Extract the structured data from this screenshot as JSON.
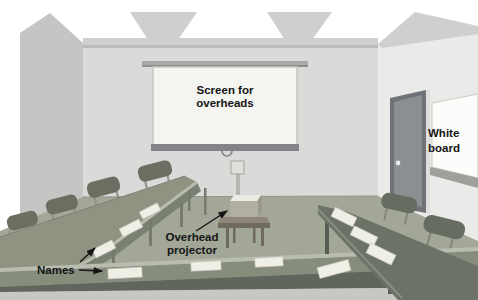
{
  "diagram": {
    "labels": {
      "screen": {
        "line1": "Screen for",
        "line2": "overheads"
      },
      "whiteboard": {
        "line1": "White",
        "line2": "board"
      },
      "projector": {
        "line1": "Overhead",
        "line2": "projector"
      },
      "names": {
        "text": "Names"
      }
    },
    "objects": {
      "chairs_left_wall": 4,
      "chairs_right_wall": 2,
      "name_cards_left_table": 3,
      "name_cards_front_table": 4,
      "name_cards_right_table": 3,
      "tables": [
        "left table",
        "front table",
        "right table",
        "projector table"
      ],
      "fixtures": [
        "projection screen",
        "overhead projector",
        "door",
        "whiteboard"
      ]
    },
    "colors": {
      "background": "#ffffff",
      "wall_left": "#c5c5c3",
      "wall_back": "#dadad8",
      "wall_right": "#eaeae8",
      "ceiling": "#cfcfcd",
      "floor": "#a2a798",
      "table_left": "#8f9482",
      "table_front": "#878d7d",
      "table_right": "#6c7266",
      "table_edge_highlight": "#b9bdb0",
      "chair": "#6a6f62",
      "screen_surface": "#f4f4f1",
      "screen_bar": "#83838a",
      "door": "#8b8e92",
      "whiteboard": "#fcfcfa",
      "name_card": "#f0efe5",
      "label_text": "#151515"
    }
  }
}
